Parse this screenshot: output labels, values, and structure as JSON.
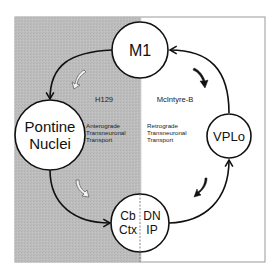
{
  "colors": {
    "shaded_region": "#b9b9b9",
    "frame": "#9a9a9a",
    "stroke": "#111111",
    "node_fill": "#ffffff",
    "hollow_arrow_fill": "#f2f2f2"
  },
  "nodes": {
    "m1": {
      "label": "M1"
    },
    "pontine": {
      "line1": "Pontine",
      "line2": "Nuclei"
    },
    "vplo": {
      "label": "VPLo"
    },
    "cerebellum": {
      "left_line1": "Cb",
      "left_line2": "Ctx",
      "right_line1": "DN",
      "right_line2": "IP"
    }
  },
  "tracers": {
    "left": "H129",
    "right": "McIntyre-B"
  },
  "transport": {
    "left": {
      "line1": "Anterograde",
      "line2": "Transneuronal",
      "line3": "Transport"
    },
    "right": {
      "line1": "Retrograde",
      "line2": "Transneuronal",
      "line3": "Transport"
    }
  },
  "icons": {
    "anterograde_direction": "hollow-curved-arrow-icon",
    "retrograde_direction": "solid-curved-arrow-icon"
  }
}
